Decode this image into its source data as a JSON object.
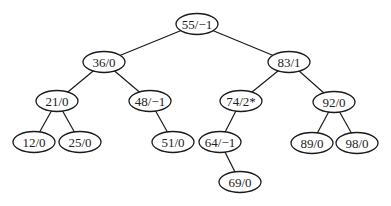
{
  "diagram": {
    "type": "binary-search-tree",
    "style": {
      "line_color": "#1a1a1a",
      "node_fill": "#ffffff",
      "text_color": "#222222"
    },
    "nodes": [
      {
        "id": "n55",
        "label": "55/−1",
        "key": 55,
        "balance": "-1",
        "x": 197,
        "y": 24,
        "rx": 21,
        "ry": 10.5
      },
      {
        "id": "n36",
        "label": "36/0",
        "key": 36,
        "balance": "0",
        "x": 104,
        "y": 62,
        "rx": 21,
        "ry": 10.5
      },
      {
        "id": "n83",
        "label": "83/1",
        "key": 83,
        "balance": "1",
        "x": 289,
        "y": 62,
        "rx": 21,
        "ry": 10.5
      },
      {
        "id": "n21",
        "label": "21/0",
        "key": 21,
        "balance": "0",
        "x": 57,
        "y": 101,
        "rx": 21,
        "ry": 10.5
      },
      {
        "id": "n48",
        "label": "48/−1",
        "key": 48,
        "balance": "-1",
        "x": 150,
        "y": 101,
        "rx": 21,
        "ry": 10.5
      },
      {
        "id": "n74",
        "label": "74/2*",
        "key": 74,
        "balance": "2*",
        "x": 241,
        "y": 101,
        "rx": 21,
        "ry": 10.5
      },
      {
        "id": "n92",
        "label": "92/0",
        "key": 92,
        "balance": "0",
        "x": 334,
        "y": 102,
        "rx": 21,
        "ry": 10.5
      },
      {
        "id": "n12",
        "label": "12/0",
        "key": 12,
        "balance": "0",
        "x": 34,
        "y": 142,
        "rx": 21,
        "ry": 10.5
      },
      {
        "id": "n25",
        "label": "25/0",
        "key": 25,
        "balance": "0",
        "x": 80,
        "y": 142,
        "rx": 21,
        "ry": 10.5
      },
      {
        "id": "n51",
        "label": "51/0",
        "key": 51,
        "balance": "0",
        "x": 173,
        "y": 142,
        "rx": 21,
        "ry": 10.5
      },
      {
        "id": "n64",
        "label": "64/−1",
        "key": 64,
        "balance": "-1",
        "x": 220,
        "y": 142,
        "rx": 21,
        "ry": 10.5
      },
      {
        "id": "n89",
        "label": "89/0",
        "key": 89,
        "balance": "0",
        "x": 312,
        "y": 143,
        "rx": 21,
        "ry": 10.5
      },
      {
        "id": "n98",
        "label": "98/0",
        "key": 98,
        "balance": "0",
        "x": 357,
        "y": 143,
        "rx": 21,
        "ry": 10.5
      },
      {
        "id": "n69",
        "label": "69/0",
        "key": 69,
        "balance": "0",
        "x": 240,
        "y": 182,
        "rx": 21,
        "ry": 10.5
      }
    ],
    "edges": [
      {
        "from": "n55",
        "to": "n36"
      },
      {
        "from": "n55",
        "to": "n83"
      },
      {
        "from": "n36",
        "to": "n21"
      },
      {
        "from": "n36",
        "to": "n48"
      },
      {
        "from": "n83",
        "to": "n74"
      },
      {
        "from": "n83",
        "to": "n92"
      },
      {
        "from": "n21",
        "to": "n12"
      },
      {
        "from": "n21",
        "to": "n25"
      },
      {
        "from": "n48",
        "to": "n51"
      },
      {
        "from": "n74",
        "to": "n64"
      },
      {
        "from": "n92",
        "to": "n89"
      },
      {
        "from": "n92",
        "to": "n98"
      },
      {
        "from": "n64",
        "to": "n69"
      }
    ]
  }
}
